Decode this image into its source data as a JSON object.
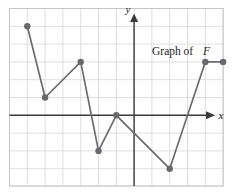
{
  "figure": {
    "caption_text": "Graph of",
    "caption_symbol": "F",
    "x_axis_label": "x",
    "y_axis_label": "y",
    "colors": {
      "grid": "#d9d4d6",
      "frame": "#c9c4c6",
      "axis": "#3a3a3a",
      "curve": "#6e6a74",
      "marker": "#6b6770",
      "background": "#ffffff"
    }
  },
  "chart_data": {
    "type": "line",
    "title": "Graph of F",
    "xlabel": "x",
    "ylabel": "y",
    "grid": true,
    "legend": "none",
    "xlim": [
      -6.65,
      5.55
    ],
    "ylim": [
      -4.2,
      5.85
    ],
    "xticks": [
      -6,
      -5,
      -4,
      -3,
      -2,
      -1,
      0,
      1,
      2,
      3,
      4,
      5
    ],
    "yticks": [
      -4,
      -3,
      -2,
      -1,
      0,
      1,
      2,
      3,
      4,
      5
    ],
    "tick_labels_shown": false,
    "series": [
      {
        "name": "F",
        "marker": "filled-circle",
        "x": [
          -6,
          -5,
          -3,
          -2,
          -1,
          2,
          4,
          5
        ],
        "y": [
          5,
          1,
          3,
          -2,
          0,
          -3,
          3,
          3
        ],
        "points": [
          {
            "label": "p1",
            "x": -6,
            "y": 5
          },
          {
            "label": "p2",
            "x": -5,
            "y": 1
          },
          {
            "label": "p3",
            "x": -3,
            "y": 3
          },
          {
            "label": "p4",
            "x": -2,
            "y": -2
          },
          {
            "label": "p5",
            "x": -1,
            "y": 0
          },
          {
            "label": "p6",
            "x": 2,
            "y": -3
          },
          {
            "label": "p7",
            "x": 4,
            "y": 3
          },
          {
            "label": "p8",
            "x": 5,
            "y": 3
          }
        ]
      }
    ],
    "annotations": [
      {
        "text": "Graph of F",
        "x": 2.1,
        "y": 4.1
      }
    ]
  }
}
